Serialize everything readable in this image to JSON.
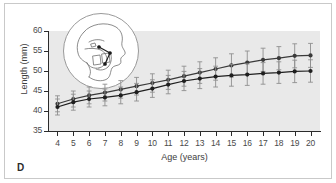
{
  "figure": {
    "panel_label": "D",
    "inset": {
      "name": "cephalometric-tracing",
      "description": "lateral skull cephalometric tracing in circle"
    }
  },
  "chart_data": {
    "type": "line",
    "title": "",
    "xlabel": "Age (years)",
    "ylabel": "Length (mm)",
    "xlim": [
      3.4,
      20.6
    ],
    "ylim": [
      35,
      60
    ],
    "yticks": [
      35,
      40,
      45,
      50,
      55,
      60
    ],
    "ytick_labels": [
      "35",
      "40",
      "45",
      "50",
      "55",
      "60"
    ],
    "x": [
      4,
      5,
      6,
      7,
      8,
      9,
      10,
      11,
      12,
      13,
      14,
      15,
      16,
      17,
      18,
      19,
      20
    ],
    "xtick_labels": [
      "4",
      "5",
      "6",
      "7",
      "8",
      "9",
      "10",
      "11",
      "12",
      "13",
      "14",
      "15",
      "16",
      "17",
      "18",
      "19",
      "20"
    ],
    "grid": false,
    "legend": "none",
    "error_bars": "symmetric standard deviation",
    "series": [
      {
        "name": "upper-series",
        "color": "#3a3a3a",
        "marker": "circle",
        "values": [
          41.8,
          43.0,
          43.9,
          44.6,
          45.4,
          46.2,
          47.0,
          47.8,
          48.7,
          49.6,
          50.5,
          51.4,
          52.1,
          52.8,
          53.2,
          53.8,
          53.9
        ],
        "errors": [
          2.0,
          2.0,
          2.1,
          2.1,
          2.2,
          2.2,
          2.3,
          2.4,
          2.5,
          2.7,
          2.8,
          2.9,
          2.9,
          2.9,
          2.9,
          3.0,
          3.0
        ]
      },
      {
        "name": "lower-series",
        "color": "#1f1f1f",
        "marker": "circle",
        "values": [
          41.0,
          42.2,
          43.0,
          43.4,
          43.9,
          44.7,
          45.6,
          46.6,
          47.5,
          48.1,
          48.6,
          48.9,
          49.1,
          49.4,
          49.6,
          49.9,
          50.0
        ],
        "errors": [
          2.0,
          2.0,
          2.0,
          2.1,
          2.1,
          2.2,
          2.2,
          2.3,
          2.4,
          2.5,
          2.6,
          2.7,
          2.7,
          2.7,
          2.7,
          2.8,
          2.8
        ]
      }
    ]
  },
  "colors": {
    "plot_background": "#e9e9e9",
    "axis": "#2b2b2b",
    "frame": "#c9c9c9",
    "series_upper": "#3a3a3a",
    "series_lower": "#1f1f1f",
    "error_bar": "#8f8f8f"
  }
}
